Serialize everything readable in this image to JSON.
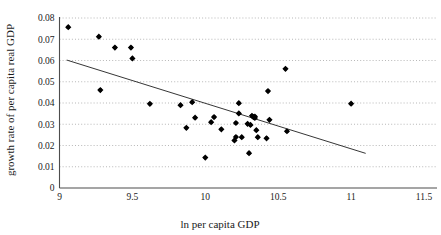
{
  "chart_data": {
    "type": "scatter",
    "title": "",
    "subtitle": "",
    "xlabel": "ln per capita GDP",
    "ylabel": "growth rate of per capita real GDP",
    "xlim": [
      9,
      11.5
    ],
    "ylim": [
      0,
      0.08
    ],
    "xticks": [
      9,
      9.5,
      10,
      10.5,
      11,
      11.5
    ],
    "xtick_labels": [
      "9",
      "9.5",
      "10",
      "10.5",
      "11",
      "11.5"
    ],
    "yticks": [
      0,
      0.01,
      0.02,
      0.03,
      0.04,
      0.05,
      0.06,
      0.07,
      0.08
    ],
    "ytick_labels": [
      "0",
      "0.01",
      "0.02",
      "0.03",
      "0.04",
      "0.05",
      "0.06",
      "0.07",
      "0.08"
    ],
    "grid": "horizontal-dotted",
    "legend": "none",
    "marker_color": "#000000",
    "marker_size": 3.1,
    "series": [
      {
        "name": "countries",
        "points": [
          [
            9.06,
            0.0757
          ],
          [
            9.27,
            0.0712
          ],
          [
            9.28,
            0.0461
          ],
          [
            9.38,
            0.0661
          ],
          [
            9.49,
            0.0661
          ],
          [
            9.5,
            0.061
          ],
          [
            9.62,
            0.0396
          ],
          [
            9.83,
            0.039
          ],
          [
            9.87,
            0.0283
          ],
          [
            9.91,
            0.0404
          ],
          [
            9.93,
            0.0331
          ],
          [
            10.0,
            0.0143
          ],
          [
            10.04,
            0.031
          ],
          [
            10.06,
            0.0334
          ],
          [
            10.11,
            0.0276
          ],
          [
            10.2,
            0.0224
          ],
          [
            10.21,
            0.0306
          ],
          [
            10.21,
            0.024
          ],
          [
            10.23,
            0.0351
          ],
          [
            10.23,
            0.0399
          ],
          [
            10.25,
            0.0239
          ],
          [
            10.29,
            0.0302
          ],
          [
            10.3,
            0.0164
          ],
          [
            10.31,
            0.0297
          ],
          [
            10.32,
            0.034
          ],
          [
            10.33,
            0.0334
          ],
          [
            10.34,
            0.0336
          ],
          [
            10.34,
            0.033
          ],
          [
            10.35,
            0.0272
          ],
          [
            10.36,
            0.0239
          ],
          [
            10.42,
            0.0234
          ],
          [
            10.43,
            0.0456
          ],
          [
            10.44,
            0.0321
          ],
          [
            10.55,
            0.0561
          ],
          [
            10.56,
            0.0267
          ],
          [
            11.0,
            0.0397
          ]
        ]
      }
    ],
    "trendline": {
      "type": "line",
      "x_start": 9.05,
      "y_start": 0.0602,
      "x_end": 11.1,
      "y_end": 0.0163,
      "color": "#2b2b2b"
    }
  },
  "figure": {
    "background_color": "#ffffff",
    "axis_color": "#4d4d4d",
    "grid_color": "#9a9a9a"
  }
}
